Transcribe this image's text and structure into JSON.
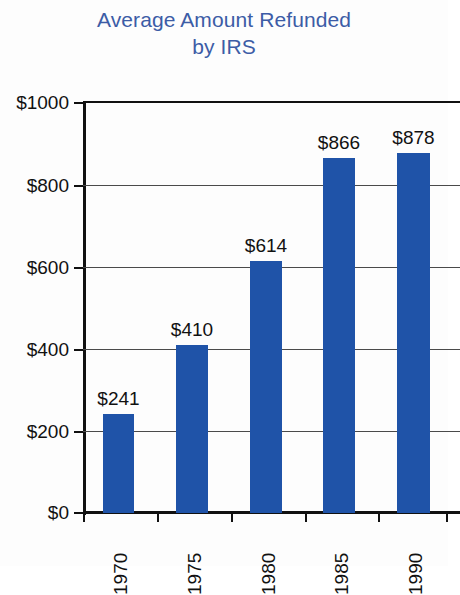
{
  "chart_data": {
    "type": "bar",
    "title": "Average Amount Refunded by IRS",
    "title_lines": [
      "Average Amount Refunded",
      "by IRS"
    ],
    "xlabel": "",
    "ylabel": "",
    "categories": [
      "1970",
      "1975",
      "1980",
      "1985",
      "1990"
    ],
    "values": [
      241,
      410,
      614,
      866,
      878
    ],
    "value_labels": [
      "$241",
      "$410",
      "$614",
      "$866",
      "$878"
    ],
    "ylim": [
      0,
      1000
    ],
    "yticks": [
      0,
      200,
      400,
      600,
      800,
      1000
    ],
    "ytick_labels": [
      "$0",
      "$200",
      "$400",
      "$600",
      "$800",
      "$1000"
    ],
    "grid": "horizontal",
    "legend": "none",
    "series": [
      {
        "name": "Average refund",
        "values": [
          241,
          410,
          614,
          866,
          878
        ]
      }
    ],
    "colors": {
      "bar": "#1f53a8",
      "title": "#3c5ca6",
      "axis": "#111111",
      "gridline": "#4a4a4a",
      "background": "#fdfdfd"
    }
  }
}
